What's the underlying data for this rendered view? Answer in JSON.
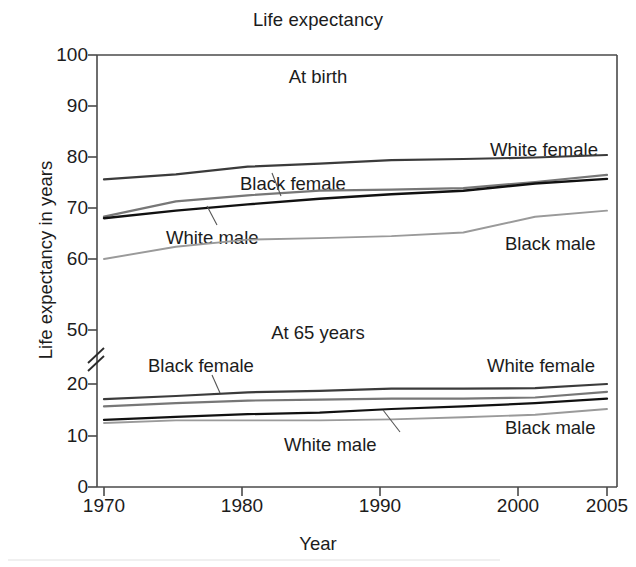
{
  "chart_data": {
    "type": "line",
    "title": "Life expectancy",
    "xlabel": "Year",
    "ylabel": "Life expectancy in years",
    "xlim": [
      1970,
      2005
    ],
    "ylim": [
      0,
      100
    ],
    "grid": false,
    "legend_position": "inline-annotations",
    "axis_break": {
      "present": true,
      "between": [
        20,
        50
      ],
      "note": "broken y-axis between 20 and 50"
    },
    "y_ticks": [
      "0",
      "10",
      "20",
      "50",
      "60",
      "70",
      "80",
      "90",
      "100"
    ],
    "x_ticks": [
      "1970",
      "1980",
      "1990",
      "2000",
      "2005"
    ],
    "panels": [
      {
        "name": "At birth",
        "label": "At birth"
      },
      {
        "name": "At 65 years",
        "label": "At 65 years"
      }
    ],
    "x": [
      1970,
      1975,
      1980,
      1985,
      1990,
      1995,
      2000,
      2005
    ],
    "series": [
      {
        "name": "White female at birth",
        "panel": "At birth",
        "label": "White female",
        "color": "#3b3b3b",
        "values": [
          75.6,
          76.6,
          78.1,
          78.7,
          79.4,
          79.6,
          79.9,
          80.4
        ]
      },
      {
        "name": "Black female at birth",
        "panel": "At birth",
        "label": "Black female",
        "color": "#777777",
        "values": [
          68.3,
          71.3,
          72.5,
          73.4,
          73.6,
          73.9,
          75.1,
          76.5
        ]
      },
      {
        "name": "White male at birth",
        "panel": "At birth",
        "label": "White male",
        "color": "#111111",
        "values": [
          68.0,
          69.5,
          70.7,
          71.8,
          72.7,
          73.4,
          74.8,
          75.7
        ]
      },
      {
        "name": "Black male at birth",
        "panel": "At birth",
        "label": "Black male",
        "color": "#9a9a9a",
        "values": [
          60.0,
          62.4,
          63.8,
          64.1,
          64.5,
          65.2,
          68.3,
          69.5
        ]
      },
      {
        "name": "White female at 65",
        "panel": "At 65 years",
        "label": "White female",
        "color": "#3b3b3b",
        "values": [
          17.1,
          17.7,
          18.4,
          18.7,
          19.1,
          19.1,
          19.2,
          20.0
        ]
      },
      {
        "name": "Black female at 65",
        "panel": "At 65 years",
        "label": "Black female",
        "color": "#777777",
        "values": [
          15.7,
          16.3,
          16.8,
          17.0,
          17.2,
          17.2,
          17.4,
          18.5
        ]
      },
      {
        "name": "White male at 65",
        "panel": "At 65 years",
        "label": "White male",
        "color": "#111111",
        "values": [
          13.1,
          13.7,
          14.2,
          14.5,
          15.2,
          15.7,
          16.3,
          17.2
        ]
      },
      {
        "name": "Black male at 65",
        "panel": "At 65 years",
        "label": "Black male",
        "color": "#9a9a9a",
        "values": [
          12.5,
          13.0,
          13.0,
          13.0,
          13.2,
          13.6,
          14.1,
          15.2
        ]
      }
    ],
    "annotations": [
      {
        "text": "White female",
        "panel": "At birth",
        "for": "White female at birth"
      },
      {
        "text": "Black female",
        "panel": "At birth",
        "for": "Black female at birth"
      },
      {
        "text": "White male",
        "panel": "At birth",
        "for": "White male at birth"
      },
      {
        "text": "Black male",
        "panel": "At birth",
        "for": "Black male at birth"
      },
      {
        "text": "White female",
        "panel": "At 65 years",
        "for": "White female at 65"
      },
      {
        "text": "Black female",
        "panel": "At 65 years",
        "for": "Black female at 65"
      },
      {
        "text": "White male",
        "panel": "At 65 years",
        "for": "White male at 65"
      },
      {
        "text": "Black male",
        "panel": "At 65 years",
        "for": "Black male at 65"
      }
    ]
  },
  "axes": {
    "y_ticks": [
      {
        "label": "100"
      },
      {
        "label": "90"
      },
      {
        "label": "80"
      },
      {
        "label": "70"
      },
      {
        "label": "60"
      },
      {
        "label": "50"
      },
      {
        "label": "20"
      },
      {
        "label": "10"
      },
      {
        "label": "0"
      }
    ],
    "x_ticks": [
      {
        "label": "1970"
      },
      {
        "label": "1980"
      },
      {
        "label": "1990"
      },
      {
        "label": "2000"
      },
      {
        "label": "2005"
      }
    ]
  },
  "labels": {
    "birth_wf": "White female",
    "birth_bf": "Black female",
    "birth_wm": "White male",
    "birth_bm": "Black male",
    "age65_wf": "White female",
    "age65_bf": "Black female",
    "age65_wm": "White male",
    "age65_bm": "Black male"
  }
}
